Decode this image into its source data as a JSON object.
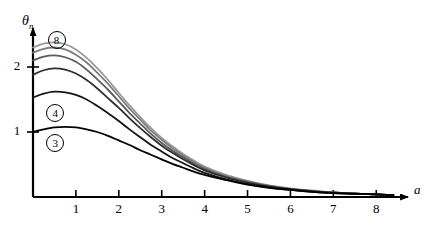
{
  "chart_data": {
    "type": "line",
    "title": "",
    "subtitle": "",
    "xlabel": "a",
    "ylabel": "θ",
    "ylabel_sub": "n",
    "xlim": [
      0,
      8.6
    ],
    "ylim": [
      0,
      2.55
    ],
    "xticks": [
      1,
      2,
      3,
      4,
      5,
      6,
      7,
      8
    ],
    "xtick_labels": [
      "1",
      "2",
      "3",
      "4",
      "5",
      "6",
      "7",
      "8"
    ],
    "yticks": [
      1,
      2
    ],
    "ytick_labels": [
      "1",
      "2"
    ],
    "grid": false,
    "legend_position": "inline-annotations",
    "annotations": [
      {
        "label": "8",
        "x": 0.55,
        "y": 2.42,
        "style": "circled"
      },
      {
        "label": "4",
        "x": 0.52,
        "y": 1.3,
        "style": "circled"
      },
      {
        "label": "3",
        "x": 0.52,
        "y": 0.83,
        "style": "circled"
      }
    ],
    "x": [
      0,
      0.25,
      0.5,
      0.75,
      1,
      1.25,
      1.5,
      1.75,
      2,
      2.25,
      2.5,
      2.75,
      3,
      3.25,
      3.5,
      3.75,
      4,
      4.5,
      5,
      5.5,
      6,
      6.5,
      7,
      7.5,
      8,
      8.4
    ],
    "series": [
      {
        "name": "8",
        "color": "#9a9a9a",
        "width": 1.8,
        "values": [
          2.3,
          2.36,
          2.38,
          2.35,
          2.27,
          2.14,
          1.98,
          1.8,
          1.6,
          1.41,
          1.23,
          1.06,
          0.91,
          0.78,
          0.66,
          0.56,
          0.47,
          0.34,
          0.25,
          0.18,
          0.13,
          0.1,
          0.07,
          0.05,
          0.04,
          0.03
        ]
      },
      {
        "name": "7",
        "color": "#7d7d7d",
        "width": 1.8,
        "values": [
          2.22,
          2.28,
          2.3,
          2.27,
          2.19,
          2.07,
          1.91,
          1.74,
          1.55,
          1.36,
          1.19,
          1.02,
          0.88,
          0.75,
          0.64,
          0.54,
          0.45,
          0.32,
          0.24,
          0.17,
          0.13,
          0.09,
          0.07,
          0.05,
          0.04,
          0.03
        ]
      },
      {
        "name": "6",
        "color": "#5a5a5a",
        "width": 1.8,
        "values": [
          2.1,
          2.16,
          2.18,
          2.15,
          2.08,
          1.96,
          1.81,
          1.65,
          1.47,
          1.29,
          1.13,
          0.97,
          0.83,
          0.71,
          0.61,
          0.51,
          0.43,
          0.31,
          0.23,
          0.17,
          0.12,
          0.09,
          0.07,
          0.05,
          0.04,
          0.03
        ]
      },
      {
        "name": "5",
        "color": "#2e2e2e",
        "width": 1.8,
        "values": [
          1.88,
          1.95,
          1.98,
          1.96,
          1.9,
          1.8,
          1.67,
          1.52,
          1.37,
          1.21,
          1.06,
          0.92,
          0.79,
          0.68,
          0.58,
          0.49,
          0.41,
          0.3,
          0.22,
          0.16,
          0.12,
          0.09,
          0.07,
          0.05,
          0.04,
          0.03
        ]
      },
      {
        "name": "4",
        "color": "#151515",
        "width": 1.8,
        "values": [
          1.53,
          1.59,
          1.62,
          1.61,
          1.57,
          1.5,
          1.4,
          1.29,
          1.17,
          1.04,
          0.92,
          0.8,
          0.7,
          0.6,
          0.52,
          0.44,
          0.37,
          0.27,
          0.2,
          0.15,
          0.11,
          0.08,
          0.06,
          0.05,
          0.04,
          0.03
        ]
      },
      {
        "name": "3",
        "color": "#000000",
        "width": 1.8,
        "values": [
          1.0,
          1.04,
          1.07,
          1.08,
          1.07,
          1.04,
          1.0,
          0.94,
          0.87,
          0.8,
          0.72,
          0.65,
          0.58,
          0.51,
          0.45,
          0.39,
          0.34,
          0.26,
          0.19,
          0.14,
          0.11,
          0.08,
          0.06,
          0.05,
          0.04,
          0.03
        ]
      }
    ]
  }
}
